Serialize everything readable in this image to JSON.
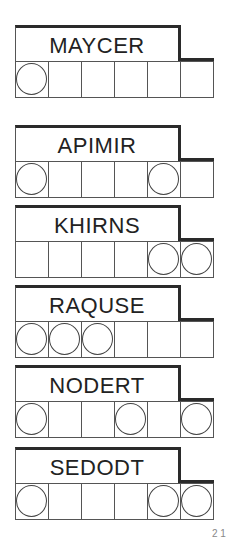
{
  "puzzle": {
    "jumbles": [
      {
        "scrambled": "MAYCER",
        "top": 25,
        "circled": [
          true,
          false,
          false,
          false,
          false,
          false
        ]
      },
      {
        "scrambled": "APIMIR",
        "top": 125,
        "circled": [
          true,
          false,
          false,
          false,
          true,
          false
        ]
      },
      {
        "scrambled": "KHIRNS",
        "top": 205,
        "circled": [
          false,
          false,
          false,
          false,
          true,
          true
        ]
      },
      {
        "scrambled": "RAQUSE",
        "top": 285,
        "circled": [
          true,
          true,
          true,
          false,
          false,
          false
        ]
      },
      {
        "scrambled": "NODERT",
        "top": 365,
        "circled": [
          true,
          false,
          false,
          true,
          false,
          true
        ]
      },
      {
        "scrambled": "SEDODT",
        "top": 447,
        "circled": [
          true,
          false,
          false,
          false,
          true,
          true
        ]
      }
    ],
    "corner_fragment": "2 1"
  }
}
